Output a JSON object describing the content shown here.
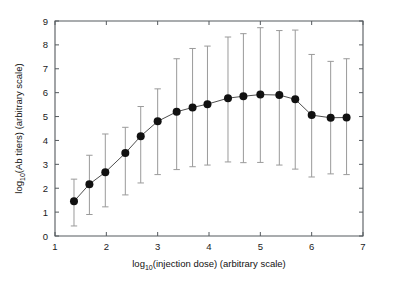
{
  "figure": {
    "background": "#ffffff",
    "marker_color": "#111111",
    "line_color": "#3a3a3a",
    "errorbar_color": "#9a9a9a",
    "axis_color": "#555a5e"
  },
  "axes": {
    "x_title_main": "log",
    "x_title_sub": "10",
    "x_title_rest": "(injection dose) (arbitrary scale)",
    "y_title_main": "log",
    "y_title_sub": "10",
    "y_title_rest": "(Ab titers) (arbitrary scale)",
    "x_ticks": [
      "1",
      "2",
      "3",
      "4",
      "5",
      "6",
      "7"
    ],
    "y_ticks": [
      "0",
      "1",
      "2",
      "3",
      "4",
      "5",
      "6",
      "7",
      "8",
      "9"
    ]
  },
  "chart_data": {
    "type": "line",
    "title": "",
    "xlabel": "log10(injection dose) (arbitrary scale)",
    "ylabel": "log10(Ab titers) (arbitrary scale)",
    "xlim": [
      1,
      7
    ],
    "ylim": [
      0,
      9
    ],
    "xticks": [
      1,
      2,
      3,
      4,
      5,
      6,
      7
    ],
    "yticks": [
      0,
      1,
      2,
      3,
      4,
      5,
      6,
      7,
      8,
      9
    ],
    "grid": false,
    "legend": "none",
    "marker": "filled-circle",
    "errorbars": "asymmetric vertical with caps",
    "x": [
      1.37,
      1.67,
      1.98,
      2.37,
      2.67,
      3.0,
      3.37,
      3.68,
      3.97,
      4.37,
      4.67,
      5.0,
      5.37,
      5.68,
      6.0,
      6.37,
      6.68
    ],
    "values": [
      1.45,
      2.17,
      2.67,
      3.47,
      4.18,
      4.8,
      5.2,
      5.38,
      5.52,
      5.77,
      5.85,
      5.92,
      5.9,
      5.72,
      5.06,
      4.95,
      4.96
    ],
    "yerr_lower": [
      0.42,
      0.9,
      1.22,
      1.72,
      2.22,
      2.57,
      2.78,
      2.9,
      2.97,
      3.1,
      3.07,
      3.08,
      2.97,
      2.8,
      2.47,
      2.6,
      2.57
    ],
    "yerr_upper": [
      2.38,
      3.38,
      4.27,
      4.55,
      5.42,
      6.16,
      7.42,
      7.85,
      7.95,
      8.33,
      8.47,
      8.72,
      8.6,
      8.62,
      7.6,
      7.31,
      7.42
    ]
  }
}
